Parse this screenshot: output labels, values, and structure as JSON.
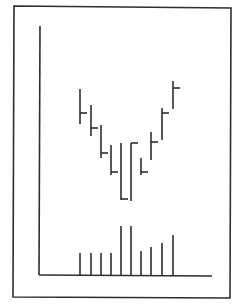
{
  "colors": {
    "ink": "#2e2e2e",
    "background": "#ffffff"
  },
  "chart_data": {
    "type": "bar",
    "subtype": "ohlc-with-volume",
    "title": "",
    "xlabel": "",
    "ylabel": "",
    "grid": false,
    "legend": null,
    "x": [
      1,
      2,
      3,
      4,
      5,
      6,
      7,
      8,
      9,
      10
    ],
    "series": [
      {
        "name": "price",
        "note": "High/low range bars with closing tick on right; values read in relative units (pixels above x-axis)",
        "high": [
          186,
          170,
          150,
          130,
          132,
          132,
          117,
          143,
          167,
          194
        ],
        "low": [
          151,
          139,
          117,
          100,
          75,
          74,
          100,
          115,
          135,
          166
        ],
        "close": [
          162,
          147,
          122,
          103,
          76,
          132,
          103,
          133,
          162,
          187
        ]
      },
      {
        "name": "volume",
        "values": [
          22,
          22,
          22,
          22,
          49,
          49,
          24,
          28,
          32,
          40
        ]
      }
    ],
    "annotations": []
  },
  "render": {
    "frame": {
      "x1": 14,
      "y1": 6,
      "x2": 230,
      "y2": 297
    },
    "axis_origin": {
      "x": 40,
      "y": 275
    },
    "y_axis_top": 26,
    "x_axis_end": 212,
    "bar_x": [
      80,
      91,
      101,
      111,
      121,
      131,
      141,
      151,
      162,
      173
    ],
    "tick_len": 7
  }
}
